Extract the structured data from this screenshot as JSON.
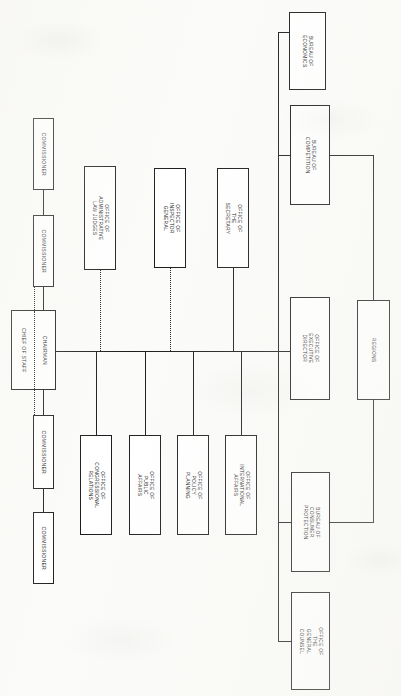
{
  "chart": {
    "orientation": "rotated-90-clockwise",
    "line_color": "#1c1c1c",
    "box_fill": "#ffffff",
    "page_background": "#fbfbf9"
  },
  "nodes": {
    "commissioner_1": {
      "label": "COMMISSIONER"
    },
    "commissioner_2": {
      "label": "COMMISSIONER"
    },
    "chairman": {
      "label": "CHAIRMAN"
    },
    "chief_of_staff": {
      "label": "CHIEF OF STAFF"
    },
    "commissioner_3": {
      "label": "COMMISSIONER"
    },
    "commissioner_4": {
      "label": "COMMISSIONER"
    },
    "office_admin_law_judges": {
      "label": "OFFICE OF\nADMINISTRATIVE\nLAW JUDGES"
    },
    "office_inspector_general": {
      "label": "OFFICE OF\nINSPECTOR GENERAL"
    },
    "office_secretary": {
      "label": "OFFICE OF THE\nSECRETARY"
    },
    "office_congressional_relations": {
      "label": "OFFICE OF\nCONGRESSIONAL\nRELATIONS"
    },
    "office_public_affairs": {
      "label": "OFFICE OF\nPUBLIC AFFAIRS"
    },
    "office_policy_planning": {
      "label": "OFFICE OF\nPOLICY PLANNING"
    },
    "office_international_affairs": {
      "label": "OFFICE OF\nINTERNATIONAL\nAFFAIRS"
    },
    "bureau_economics": {
      "label": "BUREAU OF\nECONOMICS"
    },
    "bureau_competition": {
      "label": "BUREAU OF COMPETITION"
    },
    "office_executive_director": {
      "label": "OFFICE OF\nEXECUTIVE\nDIRECTOR"
    },
    "regions": {
      "label": "REGIONS"
    },
    "bureau_consumer_protection": {
      "label": "BUREAU OF CONSUMER\nPROTECTION"
    },
    "office_general_counsel": {
      "label": "OFFICE OF THE\nGENERAL COUNSEL"
    }
  }
}
